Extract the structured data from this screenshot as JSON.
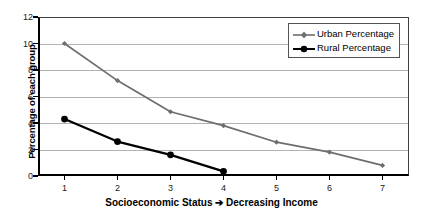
{
  "chart_data": {
    "type": "line",
    "title": "",
    "subtitle": "",
    "xlabel": "Socioeconomic Status ➔ Decreasing Income",
    "ylabel": "Percentage of each group",
    "x": [
      1,
      2,
      3,
      4,
      5,
      6,
      7
    ],
    "categories": [
      "1",
      "2",
      "3",
      "4",
      "5",
      "6",
      "7"
    ],
    "xlim": [
      0.5,
      7.5
    ],
    "ylim": [
      0,
      12
    ],
    "y_ticks": [
      0,
      2,
      4,
      6,
      8,
      10,
      12
    ],
    "y_tick_labels": [
      "0",
      "2",
      "4",
      "6",
      "8",
      "10",
      "12"
    ],
    "x_ticks": [
      1,
      2,
      3,
      4,
      5,
      6,
      7
    ],
    "x_tick_labels": [
      "1",
      "2",
      "3",
      "4",
      "5",
      "6",
      "7"
    ],
    "grid": "horizontal",
    "grid_color": "#b3b3b3",
    "legend_position": "top-right",
    "series": [
      {
        "name": "Urban Percentage",
        "color": "#6e6e6e",
        "marker": "diamond",
        "x": [
          1,
          2,
          3,
          4,
          5,
          6,
          7
        ],
        "values": [
          10.0,
          7.2,
          4.85,
          3.8,
          2.55,
          1.8,
          0.8
        ]
      },
      {
        "name": "Rural Percentage",
        "color": "#000000",
        "marker": "circle",
        "x": [
          1,
          2,
          3,
          4
        ],
        "values": [
          4.3,
          2.6,
          1.6,
          0.35
        ]
      }
    ]
  },
  "legend": {
    "items": [
      {
        "label": "Urban Percentage",
        "color": "#6e6e6e",
        "marker": "diamond"
      },
      {
        "label": "Rural Percentage",
        "color": "#000000",
        "marker": "circle"
      }
    ]
  },
  "axes": {
    "y_title": "Percentage of each group",
    "x_title": "Socioeconomic Status ➔ Decreasing Income"
  },
  "colors": {
    "urban": "#6e6e6e",
    "rural": "#000000",
    "gridline": "#b3b3b3",
    "axis": "#000000",
    "frame": "#404040",
    "background": "#ffffff"
  }
}
